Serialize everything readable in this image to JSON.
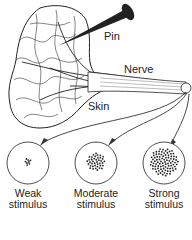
{
  "diagram": {
    "labels": {
      "pin": "Pin",
      "nerve": "Nerve",
      "skin": "Skin"
    },
    "stimuli": [
      {
        "line1": "Weak",
        "line2": "stimulus",
        "dot_count": 8
      },
      {
        "line1": "Moderate",
        "line2": "stimulus",
        "dot_count": 40
      },
      {
        "line1": "Strong",
        "line2": "stimulus",
        "dot_count": 90
      }
    ]
  }
}
